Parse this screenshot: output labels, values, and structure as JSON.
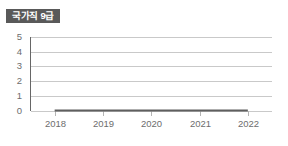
{
  "card": {
    "title": "국가직 9급",
    "badge_color": "#595959",
    "badge_text_color": "#ffffff",
    "background_color": "#ffffff"
  },
  "chart_data": {
    "type": "line",
    "title": "국가직 9급",
    "xlabel": "",
    "ylabel": "",
    "categories": [
      "2018",
      "2019",
      "2020",
      "2021",
      "2022"
    ],
    "x": [
      2018,
      2019,
      2020,
      2021,
      2022
    ],
    "values": [
      0,
      0,
      0,
      0,
      0
    ],
    "series": [
      {
        "name": "국가직 9급",
        "values": [
          0,
          0,
          0,
          0,
          0
        ],
        "color": "#5f5f5f"
      }
    ],
    "ylim": [
      0,
      5
    ],
    "yticks": [
      0,
      1,
      2,
      3,
      4,
      5
    ],
    "ytick_labels": [
      "0",
      "1",
      "2",
      "3",
      "4",
      "5"
    ],
    "xtick_labels": [
      "2018",
      "2019",
      "2020",
      "2021",
      "2022"
    ],
    "grid": true,
    "grid_axis": "y",
    "grid_color": "#c9c9c9",
    "axis_color": "#666666",
    "legend": false,
    "legend_position": "none"
  }
}
